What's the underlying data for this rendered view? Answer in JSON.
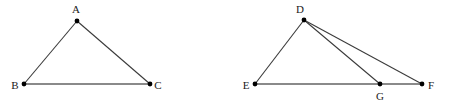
{
  "figure": {
    "background_color": "#ffffff",
    "width": 453,
    "height": 107,
    "label_color": "#1a1a1a",
    "edge_color": "#3a3a3a",
    "base_color": "#8a8a8a",
    "vertex_color": "#000000",
    "edge_width": 1.1,
    "base_width": 2.2,
    "vertex_radius": 2.4
  },
  "diagrams": [
    {
      "id": "triangle-abc",
      "name": "triangle-abc",
      "vertices": [
        {
          "id": "A",
          "label": "A",
          "x": 77,
          "y": 21,
          "label_x": 76,
          "label_y": 9
        },
        {
          "id": "B",
          "label": "B",
          "x": 24,
          "y": 84,
          "label_x": 15,
          "label_y": 85
        },
        {
          "id": "C",
          "label": "C",
          "x": 150,
          "y": 84,
          "label_x": 158,
          "label_y": 85
        }
      ],
      "edges": [
        {
          "id": "AB",
          "from": "A",
          "to": "B",
          "style": "thin"
        },
        {
          "id": "AC",
          "from": "A",
          "to": "C",
          "style": "thin"
        },
        {
          "id": "BC",
          "from": "B",
          "to": "C",
          "style": "base"
        }
      ]
    },
    {
      "id": "triangle-def-g",
      "name": "triangle-def-with-cevian",
      "vertices": [
        {
          "id": "D",
          "label": "D",
          "x": 304,
          "y": 20,
          "label_x": 300,
          "label_y": 9
        },
        {
          "id": "E",
          "label": "E",
          "x": 255,
          "y": 84,
          "label_x": 246,
          "label_y": 85
        },
        {
          "id": "G",
          "label": "G",
          "x": 380,
          "y": 84,
          "label_x": 380,
          "label_y": 96
        },
        {
          "id": "F",
          "label": "F",
          "x": 422,
          "y": 84,
          "label_x": 431,
          "label_y": 85
        }
      ],
      "edges": [
        {
          "id": "DE",
          "from": "D",
          "to": "E",
          "style": "thin"
        },
        {
          "id": "DG",
          "from": "D",
          "to": "G",
          "style": "thin"
        },
        {
          "id": "DF",
          "from": "D",
          "to": "F",
          "style": "thin"
        },
        {
          "id": "EF",
          "from": "E",
          "to": "F",
          "style": "base"
        }
      ]
    }
  ]
}
